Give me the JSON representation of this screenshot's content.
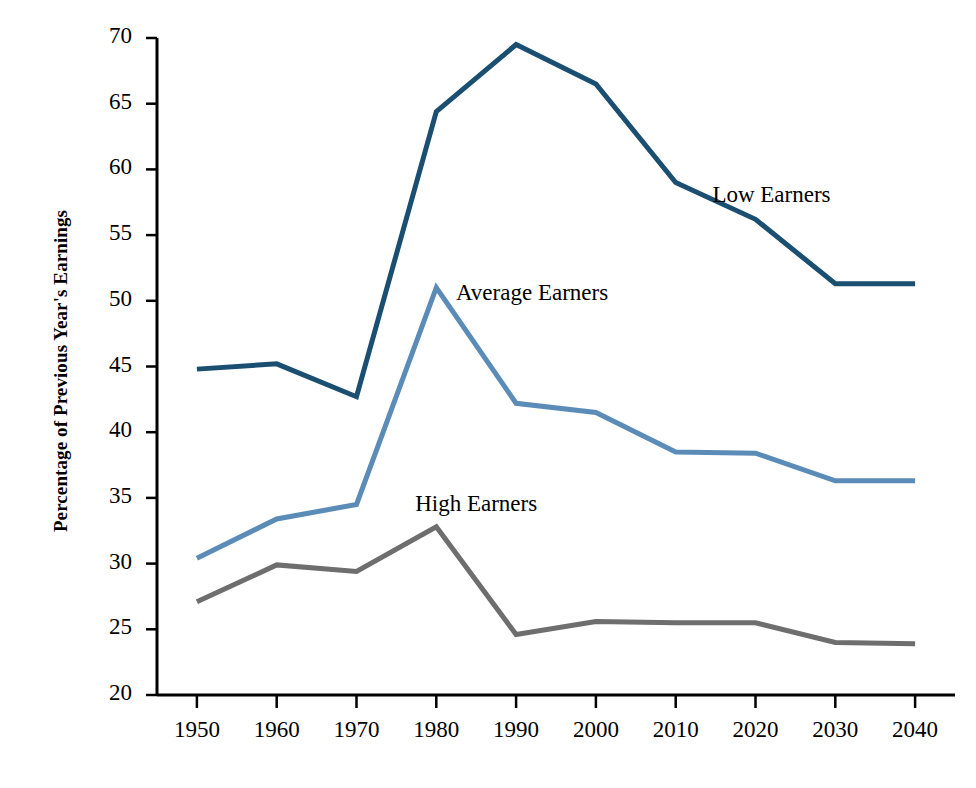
{
  "chart_data": {
    "type": "line",
    "title": "",
    "xlabel": "",
    "ylabel": "Percentage of Previous Year's Earnings",
    "x": [
      1950,
      1960,
      1970,
      1980,
      1990,
      2000,
      2010,
      2020,
      2030,
      2040
    ],
    "categories": [
      "1950",
      "1960",
      "1970",
      "1980",
      "1990",
      "2000",
      "2010",
      "2020",
      "2030",
      "2040"
    ],
    "xlim": [
      1945,
      2045
    ],
    "ylim": [
      20,
      70
    ],
    "yticks": [
      20,
      25,
      30,
      35,
      40,
      45,
      50,
      55,
      60,
      65,
      70
    ],
    "ytick_labels": [
      "20",
      "25",
      "30",
      "35",
      "40",
      "45",
      "50",
      "55",
      "60",
      "65",
      "70"
    ],
    "xticks": [
      1950,
      1960,
      1970,
      1980,
      1990,
      2000,
      2010,
      2020,
      2030,
      2040
    ],
    "grid": false,
    "legend_position": "inline-annotations",
    "series": [
      {
        "name": "Low Earners",
        "color": "#1b4f72",
        "values": [
          44.8,
          45.2,
          42.7,
          64.4,
          69.5,
          66.5,
          59.0,
          56.2,
          51.3,
          51.3
        ],
        "label_x": 2022,
        "label_y": 57.8
      },
      {
        "name": "Average Earners",
        "color": "#5b8cb8",
        "values": [
          30.4,
          33.4,
          34.5,
          51.0,
          42.2,
          41.5,
          38.5,
          38.4,
          36.3,
          36.3
        ],
        "label_x": 1992,
        "label_y": 50.4
      },
      {
        "name": "High Earners",
        "color": "#6e6e6e",
        "values": [
          27.1,
          29.9,
          29.4,
          32.8,
          24.6,
          25.6,
          25.5,
          25.5,
          24.0,
          23.9
        ],
        "label_x": 1985,
        "label_y": 34.3
      }
    ]
  },
  "axis": {
    "y_axis_name": "y-axis",
    "x_axis_name": "x-axis",
    "axis_color": "#000000"
  }
}
